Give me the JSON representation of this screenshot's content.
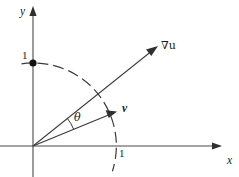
{
  "figure": {
    "background_color": "#ffffff",
    "ink_color": "#2f2f2f",
    "width": 239,
    "height": 177
  },
  "axes": {
    "origin": {
      "x": 33,
      "y": 146
    },
    "x_axis": {
      "label": "x",
      "label_pos": {
        "x": 227,
        "y": 155
      },
      "start": {
        "x": 0,
        "y": 146
      },
      "end": {
        "x": 222,
        "y": 146
      },
      "arrow": "right"
    },
    "y_axis": {
      "label": "y",
      "label_pos": {
        "x": 20,
        "y": 6
      },
      "start": {
        "x": 33,
        "y": 177
      },
      "end": {
        "x": 33,
        "y": 7
      },
      "arrow": "up"
    }
  },
  "ticks": [
    {
      "name": "y-unit-tick",
      "label": "1",
      "axis": "y",
      "value": 1,
      "label_pos": {
        "x": 22,
        "y": 50
      },
      "point": {
        "x": 33,
        "y": 63
      },
      "has_dot": true
    },
    {
      "name": "x-unit-tick",
      "label": "1",
      "axis": "x",
      "value": 1,
      "label_pos": {
        "x": 119,
        "y": 148
      },
      "point": {
        "x": 116,
        "y": 146
      },
      "has_dot": false
    }
  ],
  "unit_arc": {
    "name": "unit-circle-arc",
    "style": "dashed",
    "radius": 83,
    "center": {
      "x": 33,
      "y": 146
    },
    "start_angle_deg": 98,
    "end_angle_deg": -17,
    "dash_pattern": "11 5"
  },
  "vectors": [
    {
      "name": "gradient-vector",
      "label": "∇u",
      "label_plain": "grad u",
      "label_pos": {
        "x": 161,
        "y": 40
      },
      "from": {
        "x": 33,
        "y": 146
      },
      "to": {
        "x": 157,
        "y": 47
      },
      "angle_deg": 38.6,
      "style": "solid",
      "bold_label": false
    },
    {
      "name": "direction-vector",
      "label": "v",
      "label_plain": "v",
      "label_pos": {
        "x": 122,
        "y": 103
      },
      "from": {
        "x": 33,
        "y": 146
      },
      "to": {
        "x": 116,
        "y": 112
      },
      "angle_deg": 22.3,
      "style": "solid",
      "bold_label": true
    }
  ],
  "angle": {
    "name": "theta-angle",
    "label": "θ",
    "label_pos": {
      "x": 74,
      "y": 112
    },
    "vertex": {
      "x": 33,
      "y": 146
    },
    "arc_radius": 44,
    "from_angle_deg": 22.3,
    "to_angle_deg": 38.6
  }
}
